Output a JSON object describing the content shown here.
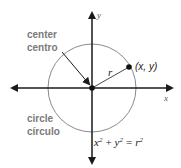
{
  "diagram": {
    "axes": {
      "x_label": "x",
      "y_label": "y"
    },
    "center_label": {
      "en": "center",
      "es": "centro"
    },
    "circle_label": {
      "en": "circle",
      "es": "círculo"
    },
    "radius_label": "r",
    "point_label": "(x, y)",
    "equation": {
      "x": "x",
      "y": "y",
      "r": "r",
      "exp": "2",
      "plus": "+",
      "eq": "="
    },
    "colors": {
      "axis": "#1a1a1a",
      "circle": "#8a8a8a",
      "label": "#7a7a7a"
    }
  }
}
